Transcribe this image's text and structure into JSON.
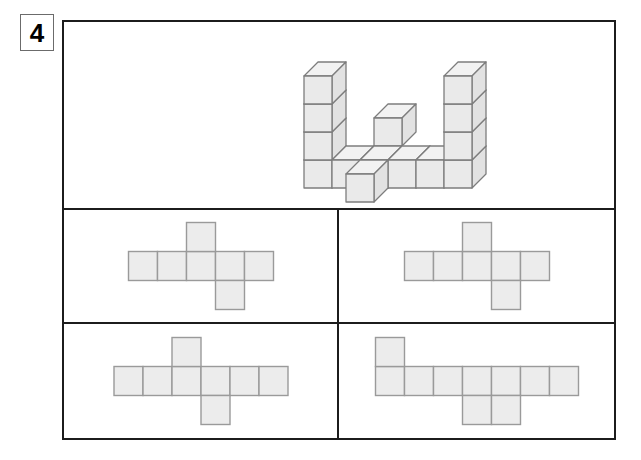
{
  "question": {
    "number": "4",
    "type": "net-of-solid-multiple-choice"
  },
  "colors": {
    "frame_stroke": "#1c1c1c",
    "badge_stroke": "#6b6b6b",
    "net_fill": "#ececec",
    "net_stroke": "#9a9a9a",
    "cube_top_fill": "#f2f2f2",
    "cube_front_fill": "#eaeaea",
    "cube_side_fill": "#e2e2e2",
    "cube_stroke": "#7d7d7d",
    "page_background": "#ffffff"
  },
  "stimulus": {
    "label": "3d-cube-solid",
    "description": "Isometric drawing of a solid built from unit cubes",
    "cube_count": 16,
    "geometry": {
      "cube_width": 28,
      "cube_height": 28,
      "depth_x": 14,
      "depth_y": -14,
      "origin_x": 240,
      "origin_y": 166
    },
    "cubes": [
      {
        "col": 0,
        "row": 0,
        "layer": 0
      },
      {
        "col": 1,
        "row": 0,
        "layer": 0
      },
      {
        "col": 2,
        "row": 0,
        "layer": 0
      },
      {
        "col": 3,
        "row": 0,
        "layer": 0
      },
      {
        "col": 4,
        "row": 0,
        "layer": 0
      },
      {
        "col": 5,
        "row": 0,
        "layer": 0
      },
      {
        "col": 0,
        "row": 0,
        "layer": 1
      },
      {
        "col": 0,
        "row": 0,
        "layer": 2
      },
      {
        "col": 0,
        "row": 0,
        "layer": 3
      },
      {
        "col": 5,
        "row": 0,
        "layer": 1
      },
      {
        "col": 5,
        "row": 0,
        "layer": 2
      },
      {
        "col": 5,
        "row": 0,
        "layer": 3
      },
      {
        "col": 2,
        "row": 1,
        "layer": 1
      },
      {
        "col": 2,
        "row": -1,
        "layer": 0
      }
    ]
  },
  "options": [
    {
      "id": "option-a",
      "position": "top-left",
      "label": "net-option-a",
      "net": {
        "cell_size": 29,
        "row_length": 5,
        "row_y": 1,
        "cells": [
          {
            "col": 0,
            "row": 1
          },
          {
            "col": 1,
            "row": 1
          },
          {
            "col": 2,
            "row": 1
          },
          {
            "col": 3,
            "row": 1
          },
          {
            "col": 4,
            "row": 1
          },
          {
            "col": 2,
            "row": 0
          },
          {
            "col": 3,
            "row": 2
          }
        ]
      }
    },
    {
      "id": "option-b",
      "position": "top-right",
      "label": "net-option-b",
      "net": {
        "cell_size": 29,
        "row_length": 5,
        "row_y": 1,
        "cells": [
          {
            "col": 0,
            "row": 1
          },
          {
            "col": 1,
            "row": 1
          },
          {
            "col": 2,
            "row": 1
          },
          {
            "col": 3,
            "row": 1
          },
          {
            "col": 4,
            "row": 1
          },
          {
            "col": 2,
            "row": 0
          },
          {
            "col": 3,
            "row": 2
          }
        ]
      }
    },
    {
      "id": "option-c",
      "position": "bottom-left",
      "label": "net-option-c",
      "net": {
        "cell_size": 29,
        "row_length": 6,
        "row_y": 1,
        "cells": [
          {
            "col": 0,
            "row": 1
          },
          {
            "col": 1,
            "row": 1
          },
          {
            "col": 2,
            "row": 1
          },
          {
            "col": 3,
            "row": 1
          },
          {
            "col": 4,
            "row": 1
          },
          {
            "col": 5,
            "row": 1
          },
          {
            "col": 2,
            "row": 0
          },
          {
            "col": 3,
            "row": 2
          }
        ]
      }
    },
    {
      "id": "option-d",
      "position": "bottom-right",
      "label": "net-option-d",
      "net": {
        "cell_size": 29,
        "row_length": 7,
        "row_y": 1,
        "cells": [
          {
            "col": 0,
            "row": 1
          },
          {
            "col": 1,
            "row": 1
          },
          {
            "col": 2,
            "row": 1
          },
          {
            "col": 3,
            "row": 1
          },
          {
            "col": 4,
            "row": 1
          },
          {
            "col": 5,
            "row": 1
          },
          {
            "col": 6,
            "row": 1
          },
          {
            "col": 0,
            "row": 0
          },
          {
            "col": 3,
            "row": 2
          },
          {
            "col": 4,
            "row": 2
          }
        ]
      }
    }
  ]
}
